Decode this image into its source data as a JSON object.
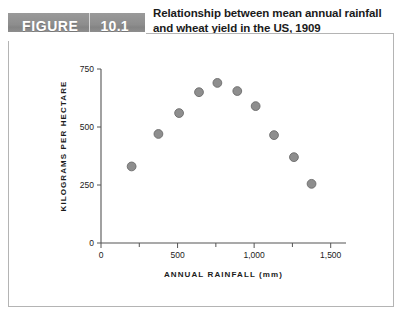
{
  "header": {
    "figure_label": "FIGURE",
    "figure_number": "10.1",
    "title_line1": "Relationship between mean annual rainfall",
    "title_line2": "and wheat yield in the US, 1909"
  },
  "colors": {
    "banner": "#8d8d8d",
    "banner_text": "#ffffff",
    "frame_border": "#b4b4b4",
    "marker_fill": "#8e8e8e",
    "marker_stroke": "#6b6b6b",
    "axis": "#555555",
    "text": "#1b1b1b"
  },
  "chart_data": {
    "type": "scatter",
    "title": "Relationship between mean annual rainfall and wheat yield in the US, 1909",
    "xlabel": "ANNUAL RAINFALL (mm)",
    "ylabel": "KILOGRAMS PER HECTARE",
    "xlim": [
      0,
      1600
    ],
    "ylim": [
      0,
      790
    ],
    "grid": false,
    "legend": null,
    "x_ticks_major": [
      0,
      500,
      1000,
      1500
    ],
    "x_tick_labels": [
      "0",
      "500",
      "1,000",
      "1,500"
    ],
    "x_ticks_minor": [
      250,
      750,
      1250
    ],
    "y_ticks": [
      0,
      250,
      500,
      750
    ],
    "y_tick_labels": [
      "0",
      "250",
      "500",
      "750"
    ],
    "x": [
      200,
      375,
      510,
      640,
      760,
      890,
      1010,
      1130,
      1260,
      1375
    ],
    "y": [
      330,
      470,
      560,
      650,
      690,
      655,
      590,
      465,
      370,
      255
    ],
    "points": [
      {
        "x": 200,
        "y": 330
      },
      {
        "x": 375,
        "y": 470
      },
      {
        "x": 510,
        "y": 560
      },
      {
        "x": 640,
        "y": 650
      },
      {
        "x": 760,
        "y": 690
      },
      {
        "x": 890,
        "y": 655
      },
      {
        "x": 1010,
        "y": 590
      },
      {
        "x": 1130,
        "y": 465
      },
      {
        "x": 1260,
        "y": 370
      },
      {
        "x": 1375,
        "y": 255
      }
    ]
  }
}
